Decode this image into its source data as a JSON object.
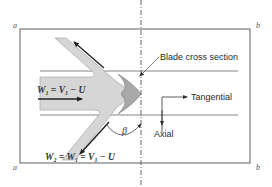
{
  "diagram": {
    "corners": {
      "top_left": "a",
      "bottom_left": "a",
      "top_right": "b",
      "bottom_right": "b"
    },
    "labels": {
      "blade_cross_section": "Blade cross section",
      "tangential": "Tangential",
      "axial": "Axial",
      "angle": "β"
    },
    "equations": {
      "inlet": {
        "W": "W",
        "W_sub": "1",
        "eq1": " = ",
        "V": "V",
        "V_sub": "1",
        "rest": " − U"
      },
      "outlet": {
        "W": "W",
        "W_sub": "2",
        "eq1": " = ",
        "W1": "W",
        "W1_sub": "1",
        "eq2": " = ",
        "V": "V",
        "V_sub": "1",
        "rest": " − U"
      }
    },
    "colors": {
      "border": "#6e6e6e",
      "channel_fill": "#d6d6d6",
      "blade_fill": "#a9a9a9",
      "arrow": "#222222",
      "text": "#2a2a2a"
    }
  }
}
